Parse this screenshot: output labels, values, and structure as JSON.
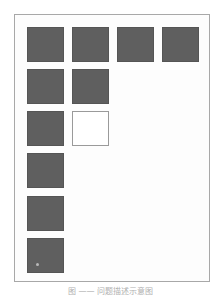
{
  "figure": {
    "caption": "图 —— 问题描述示意图",
    "colors": {
      "filled": "#5f5f5f",
      "empty": "#ffffff",
      "frame": "#a8a8a8"
    },
    "grid": {
      "rows": [
        [
          "filled",
          "filled",
          "filled",
          "filled"
        ],
        [
          "filled",
          "filled"
        ],
        [
          "filled",
          "empty"
        ],
        [
          "filled"
        ],
        [
          "filled"
        ],
        [
          "filled-marked"
        ]
      ]
    }
  }
}
